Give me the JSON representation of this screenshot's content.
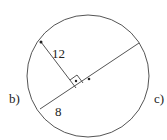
{
  "diagram": {
    "type": "circle-geometry",
    "labels": {
      "segment_perpendicular": "12",
      "segment_chord": "8",
      "left_label": "b)",
      "right_label": "c)"
    },
    "colors": {
      "stroke": "#555555",
      "text": "#222222",
      "background": "#ffffff"
    }
  }
}
